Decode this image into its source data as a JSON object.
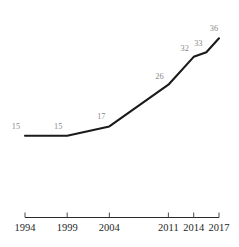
{
  "chart_data": {
    "type": "line",
    "title": "",
    "subtitle": "",
    "xlabel": "",
    "ylabel": "",
    "grid": false,
    "legend": false,
    "y_axis_visible": false,
    "x_axis_visible": true,
    "series": [
      {
        "name": "",
        "color": "#1a1a1a",
        "x": [
          1994,
          1999,
          2004,
          2011,
          2014,
          2015.5,
          2017
        ],
        "values": [
          15,
          15,
          17,
          26,
          32,
          33,
          36
        ],
        "point_labels": [
          "15",
          "15",
          "17",
          "26",
          "32",
          "33",
          "36"
        ]
      }
    ],
    "x_ticks": [
      {
        "value": 1994,
        "label": "1994"
      },
      {
        "value": 1999,
        "label": "1999"
      },
      {
        "value": 2004,
        "label": "2004"
      },
      {
        "value": 2011,
        "label": "2011"
      },
      {
        "value": 2014,
        "label": "2014"
      },
      {
        "value": 2017,
        "label": "2017"
      }
    ],
    "xlim": [
      1994,
      2017
    ],
    "ylim": [
      13,
      38
    ],
    "label_color": "#8a8a8a",
    "tick_label_color": "#1f1f1f",
    "axis_color": "#2a2a2a",
    "background_color": "#ffffff"
  }
}
